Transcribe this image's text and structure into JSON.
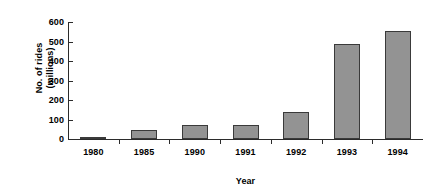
{
  "chart_data": {
    "type": "bar",
    "title": "",
    "subtitle": "",
    "xlabel": "Year",
    "ylabel_line1": "No. of rides",
    "ylabel_line2": "(millions)",
    "ylabel": "No. of rides (millions)",
    "categories": [
      "1980",
      "1985",
      "1990",
      "1991",
      "1992",
      "1993",
      "1994"
    ],
    "values": [
      5,
      44,
      72,
      72,
      139,
      489,
      556
    ],
    "ylim": [
      0,
      600
    ],
    "ytick_labels": [
      "600",
      "500",
      "400",
      "300",
      "200",
      "100",
      "0"
    ],
    "ytick_values": [
      600,
      500,
      400,
      300,
      200,
      100,
      0
    ],
    "ystep": 100,
    "grid": false,
    "legend": false,
    "legend_position": "none",
    "bar_fill_color": "#939393",
    "bar_border_color": "#3a3a3a",
    "axis_color": "#2b2b2b",
    "background_color": "#ffffff"
  }
}
